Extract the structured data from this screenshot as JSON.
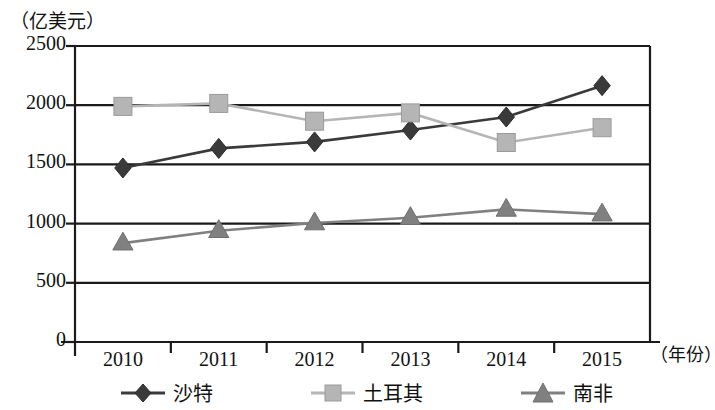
{
  "chart_data": {
    "type": "line",
    "title": "",
    "xlabel": "（年份）",
    "ylabel": "（亿美元）",
    "categories": [
      "2010",
      "2011",
      "2012",
      "2013",
      "2014",
      "2015"
    ],
    "ylim": [
      0,
      2500
    ],
    "yticks": [
      0,
      500,
      1000,
      1500,
      2000,
      2500
    ],
    "grid": true,
    "legend_position": "bottom",
    "series": [
      {
        "name": "沙特",
        "marker": "diamond",
        "color": "#3a3a3a",
        "values": [
          1470,
          1635,
          1690,
          1790,
          1900,
          2165
        ]
      },
      {
        "name": "土耳其",
        "marker": "square",
        "color": "#b5b5b5",
        "values": [
          1990,
          2015,
          1865,
          1935,
          1685,
          1810
        ]
      },
      {
        "name": "南非",
        "marker": "triangle",
        "color": "#808080",
        "values": [
          835,
          940,
          1005,
          1050,
          1120,
          1080
        ]
      }
    ]
  },
  "axis": {
    "y_unit_label": "（亿美元）",
    "x_unit_label": "（年份）",
    "y_tick_labels": [
      "2500",
      "2000",
      "1500",
      "1000",
      "500",
      "0"
    ],
    "x_tick_labels": [
      "2010",
      "2011",
      "2012",
      "2013",
      "2014",
      "2015"
    ]
  },
  "legend": {
    "items": [
      {
        "label": "沙特",
        "marker": "diamond-marker",
        "color": "#3a3a3a"
      },
      {
        "label": "土耳其",
        "marker": "square-marker",
        "color": "#b5b5b5"
      },
      {
        "label": "南非",
        "marker": "triangle-marker",
        "color": "#808080"
      }
    ]
  },
  "colors": {
    "axis": "#1a1a1a",
    "gridline": "#1a1a1a",
    "saudi": "#3a3a3a",
    "turkey": "#b5b5b5",
    "south_africa": "#808080",
    "background": "#ffffff"
  }
}
